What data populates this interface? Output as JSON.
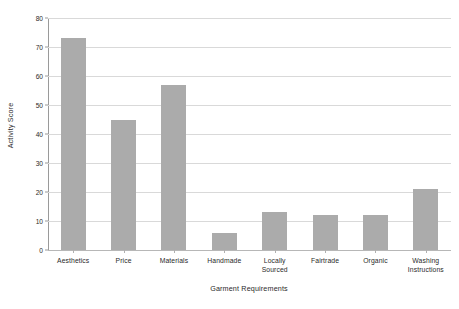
{
  "chart_data": {
    "type": "bar",
    "title": "",
    "xlabel": "Garment Requirements",
    "ylabel": "Activity Score",
    "categories": [
      "Aesthetics",
      "Price",
      "Materials",
      "Handmade",
      "Locally Sourced",
      "Fairtrade",
      "Organic",
      "Washing Instructions"
    ],
    "category_lines": [
      [
        "Aesthetics"
      ],
      [
        "Price"
      ],
      [
        "Materials"
      ],
      [
        "Handmade"
      ],
      [
        "Locally",
        "Sourced"
      ],
      [
        "Fairtrade"
      ],
      [
        "Organic"
      ],
      [
        "Washing",
        "Instructions"
      ]
    ],
    "values": [
      73,
      45,
      57,
      6,
      13,
      12,
      12,
      21
    ],
    "ylim": [
      0,
      80
    ],
    "yticks": [
      0,
      10,
      20,
      30,
      40,
      50,
      60,
      70,
      80
    ],
    "ytick_labels": [
      "0",
      "10",
      "20",
      "30",
      "40",
      "50",
      "60",
      "70",
      "80"
    ],
    "grid": true,
    "legend": false,
    "bar_color": "#ababab",
    "gridline_color": "#d9d9d9",
    "axis_color": "#9a9a9a",
    "background": "#ffffff"
  }
}
